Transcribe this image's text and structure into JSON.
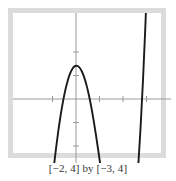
{
  "figure": {
    "caption": "[−2, 4] by [−3, 4]",
    "frame_color": "#dcdcdc",
    "plot_background": "#ffffff",
    "axis_color": "#9a9a9a",
    "curve_color": "#1a1a1a",
    "caption_color": "#353535"
  },
  "chart_data": {
    "type": "line",
    "title": "",
    "subtitle": "",
    "xlabel": "",
    "ylabel": "",
    "xlim": [
      -2,
      4
    ],
    "ylim": [
      -3,
      4
    ],
    "grid": false,
    "legend": null,
    "xticks": [
      -1,
      1,
      2,
      3
    ],
    "yticks": [
      -2,
      -1,
      1,
      2
    ],
    "xtick_labels": [],
    "ytick_labels": [],
    "annotations": [],
    "window_label": "[−2, 4] by [−3, 4]",
    "series": [
      {
        "name": "cubic",
        "x": [
          -0.95,
          -0.85,
          -0.75,
          -0.65,
          -0.55,
          -0.45,
          -0.35,
          -0.25,
          -0.15,
          -0.05,
          0.05,
          0.15,
          0.25,
          0.35,
          0.45,
          0.55,
          0.65,
          0.75,
          0.85,
          0.95,
          1.05,
          1.15,
          1.25,
          1.35,
          1.45,
          1.55,
          1.65,
          1.75,
          1.85,
          1.95,
          2.05,
          2.15,
          2.25,
          2.35,
          2.45,
          2.55,
          2.65,
          2.75,
          2.85,
          2.95,
          3.05,
          3.15,
          3.25
        ],
        "y": [
          -2.95,
          -2.1,
          -1.34,
          -0.67,
          -0.09,
          0.4,
          0.79,
          1.09,
          1.29,
          1.4,
          1.41,
          1.34,
          1.17,
          0.92,
          0.58,
          0.16,
          -0.34,
          -0.91,
          -1.54,
          -2.21,
          -2.91,
          -3.62,
          -4.32,
          -5.0,
          -5.63,
          -6.2,
          -6.69,
          -7.07,
          -7.33,
          -7.45,
          -7.41,
          -7.19,
          -6.78,
          -6.15,
          -5.29,
          -4.19,
          -2.82,
          -1.17,
          0.78,
          3.05,
          5.67,
          8.65,
          12.02
        ]
      }
    ]
  },
  "geometry": {
    "origin_x": 63,
    "origin_y": 86,
    "unit": 23.5,
    "tick_half": 3
  }
}
